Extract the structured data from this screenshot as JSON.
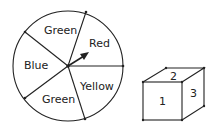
{
  "spinner": {
    "sections": [
      {
        "label": "Green"
      },
      {
        "label": "Red"
      },
      {
        "label": "Yellow"
      },
      {
        "label": "Green"
      },
      {
        "label": "Blue"
      }
    ]
  },
  "cube": {
    "faces": [
      {
        "label": "1"
      },
      {
        "label": "2"
      },
      {
        "label": "3"
      }
    ]
  }
}
